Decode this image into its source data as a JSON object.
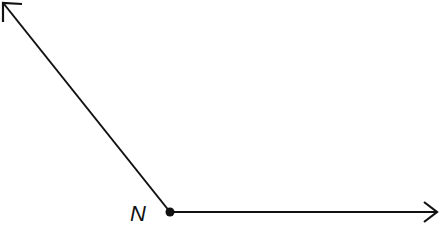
{
  "diagram": {
    "type": "angle",
    "vertex": {
      "label": "N",
      "x": 170,
      "y": 212
    },
    "rays": [
      {
        "name": "ray-upper-left",
        "end": {
          "x": 3,
          "y": 3
        }
      },
      {
        "name": "ray-right",
        "end": {
          "x": 438,
          "y": 212
        }
      }
    ],
    "colors": {
      "stroke": "#111111",
      "background": "#ffffff"
    }
  }
}
